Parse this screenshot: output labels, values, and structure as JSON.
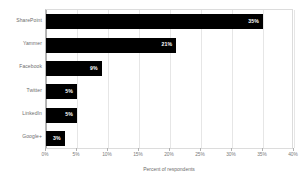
{
  "chart_data": {
    "type": "bar",
    "orientation": "horizontal",
    "title": "",
    "xlabel": "Percent of respondents",
    "ylabel": "",
    "categories": [
      "SharePoint",
      "Yammer",
      "Facebook",
      "Twitter",
      "LinkedIn",
      "Google+"
    ],
    "values": [
      35,
      21,
      9,
      5,
      5,
      3
    ],
    "value_labels": [
      "35%",
      "21%",
      "9%",
      "5%",
      "5%",
      "3%"
    ],
    "xlim": [
      0,
      40
    ],
    "xticks": [
      0,
      5,
      10,
      15,
      20,
      25,
      30,
      35,
      40
    ],
    "xtick_labels": [
      "0%",
      "5%",
      "10%",
      "15%",
      "20%",
      "25%",
      "30%",
      "35%",
      "40%"
    ],
    "grid": true,
    "legend": "none",
    "bar_color": "#000000",
    "value_label_color": "#ffffff",
    "background_color": "#ffffff",
    "gridline_color": "#e6e6e6",
    "axis_color": "#b0b0b0",
    "tick_label_color": "#7a7a7a",
    "category_label_color": "#6d6d6d"
  }
}
